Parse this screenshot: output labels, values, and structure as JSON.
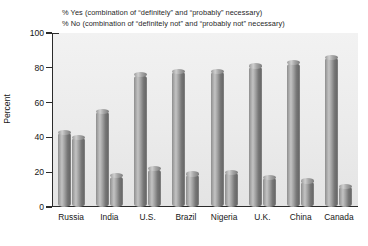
{
  "chart_data": {
    "type": "bar",
    "title": "",
    "xlabel": "",
    "ylabel": "Percent",
    "ylim": [
      0,
      100
    ],
    "yticks": [
      0,
      20,
      40,
      60,
      80,
      100
    ],
    "grid": false,
    "legend_position": "top-left",
    "categories": [
      "Russia",
      "India",
      "U.S.",
      "Brazil",
      "Nigeria",
      "U.K.",
      "China",
      "Canada"
    ],
    "series": [
      {
        "name": "% Yes (combination of “definitely” and “probably” necessary)",
        "short_name": "% Yes",
        "color": "#8f8f8f",
        "values": [
          43,
          55,
          76,
          78,
          78,
          81,
          83,
          86
        ]
      },
      {
        "name": "% No (combination of “definitely not” and “probably not” necessary)",
        "short_name": "% No",
        "color": "#8f8f8f",
        "values": [
          40,
          18,
          22,
          19,
          20,
          17,
          15,
          12
        ]
      }
    ]
  },
  "legend": {
    "line1": "% Yes (combination of “definitely” and “probably” necessary)",
    "line2": "% No (combination of “definitely not” and “probably not” necessary)"
  },
  "axes": {
    "y_title": "Percent",
    "y_tick_labels": [
      "100",
      "80",
      "60",
      "40",
      "20",
      "0"
    ],
    "x_tick_labels": [
      "Russia",
      "India",
      "U.S.",
      "Brazil",
      "Nigeria",
      "U.K.",
      "China",
      "Canada"
    ]
  },
  "colors": {
    "plot_background": "#ededed",
    "axis": "#2b2b2b",
    "bar_dark": "#6a6a6a",
    "bar_light": "#c3c3c3",
    "text": "#161616"
  }
}
